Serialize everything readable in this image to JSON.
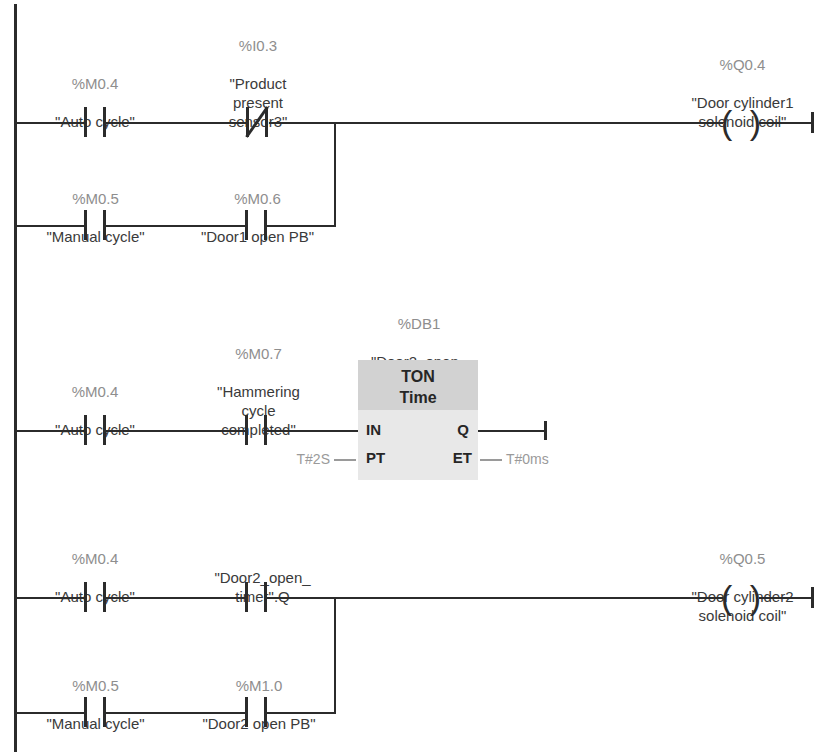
{
  "diagram": {
    "type": "ladder-logic",
    "language": "LAD",
    "networks": [
      {
        "id": "network-1",
        "output": {
          "address": "%Q0.4",
          "symbol": "\"Door cylinder1\nsolenoid coil\""
        },
        "branches": [
          {
            "id": "branch-1-1",
            "contacts": [
              {
                "address": "%M0.4",
                "symbol": "\"Auto cycle\"",
                "type": "NO"
              },
              {
                "address": "%I0.3",
                "symbol": "\"Product\npresent\nsensor3\"",
                "type": "NC"
              }
            ]
          },
          {
            "id": "branch-1-2",
            "contacts": [
              {
                "address": "%M0.5",
                "symbol": "\"Manual cycle\"",
                "type": "NO"
              },
              {
                "address": "%M0.6",
                "symbol": "\"Door1 open PB\"",
                "type": "NO"
              }
            ]
          }
        ]
      },
      {
        "id": "network-2",
        "block": {
          "db": "%DB1",
          "instance": "\"Door2_open_\ntimer\"",
          "name": "TON",
          "subtitle": "Time",
          "pins": {
            "in": "IN",
            "pt": "PT",
            "q": "Q",
            "et": "ET"
          },
          "values": {
            "pt": "T#2S",
            "et": "T#0ms"
          }
        },
        "branches": [
          {
            "id": "branch-2-1",
            "contacts": [
              {
                "address": "%M0.4",
                "symbol": "\"Auto cycle\"",
                "type": "NO"
              },
              {
                "address": "%M0.7",
                "symbol": "\"Hammering\ncycle\ncompleted\"",
                "type": "NO"
              }
            ]
          }
        ]
      },
      {
        "id": "network-3",
        "output": {
          "address": "%Q0.5",
          "symbol": "\"Door cylinder2\nsolenoid coil\""
        },
        "branches": [
          {
            "id": "branch-3-1",
            "contacts": [
              {
                "address": "%M0.4",
                "symbol": "\"Auto cycle\"",
                "type": "NO"
              },
              {
                "address": "",
                "symbol": "\"Door2_open_\ntimer\".Q",
                "type": "NO"
              }
            ]
          },
          {
            "id": "branch-3-2",
            "contacts": [
              {
                "address": "%M0.5",
                "symbol": "\"Manual cycle\"",
                "type": "NO"
              },
              {
                "address": "%M1.0",
                "symbol": "\"Door2 open PB\"",
                "type": "NO"
              }
            ]
          }
        ]
      }
    ]
  },
  "colors": {
    "wire": "#2b2b2b",
    "address_text": "#8e8e8e",
    "symbol_text": "#3a3a3a",
    "block_header": "#d2d2d2",
    "block_body": "#e8e8e8",
    "pin_value_text": "#9a9a9a",
    "background": "#ffffff"
  }
}
